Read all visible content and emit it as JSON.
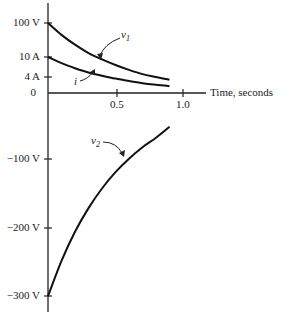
{
  "chart_data": {
    "type": "line",
    "title": "",
    "xlabel": "Time, seconds",
    "ylabel": "",
    "x_ticks": [
      "0.5",
      "1.0"
    ],
    "y_ticks": [
      "100 V",
      "10 A",
      "4 A",
      "0",
      "-100 V",
      "-200 V",
      "-300 V"
    ],
    "xlim": [
      0,
      1.1
    ],
    "grid": false,
    "legend": "inline curve labels with arrows",
    "series": [
      {
        "name": "v1",
        "unit": "V",
        "x": [
          0,
          0.1,
          0.2,
          0.3,
          0.4,
          0.5,
          0.6,
          0.7,
          0.8,
          0.9
        ],
        "values": [
          100,
          83,
          69,
          57,
          48,
          40,
          33,
          27,
          23,
          19
        ]
      },
      {
        "name": "i",
        "unit": "A",
        "x": [
          0,
          0.1,
          0.2,
          0.3,
          0.4,
          0.5,
          0.6,
          0.7,
          0.8,
          0.9
        ],
        "values": [
          10,
          8.3,
          6.9,
          5.7,
          4.8,
          4.0,
          3.3,
          2.7,
          2.3,
          1.9
        ]
      },
      {
        "name": "v2",
        "unit": "V",
        "x": [
          0,
          0.1,
          0.2,
          0.3,
          0.4,
          0.5,
          0.6,
          0.7,
          0.8,
          0.9
        ],
        "values": [
          -300,
          -248,
          -205,
          -170,
          -141,
          -117,
          -97,
          -80,
          -66,
          -50
        ]
      }
    ]
  },
  "labels": {
    "y100v": "100 V",
    "y10a": "10 A",
    "y4a": "4 A",
    "y0": "0",
    "yneg100": "−100 V",
    "yneg200": "−200 V",
    "yneg300": "−300 V",
    "x05": "0.5",
    "x10": "1.0",
    "xaxis": "Time, seconds",
    "v1": "v",
    "v1_sub": "1",
    "i": "i",
    "v2": "v",
    "v2_sub": "2"
  }
}
